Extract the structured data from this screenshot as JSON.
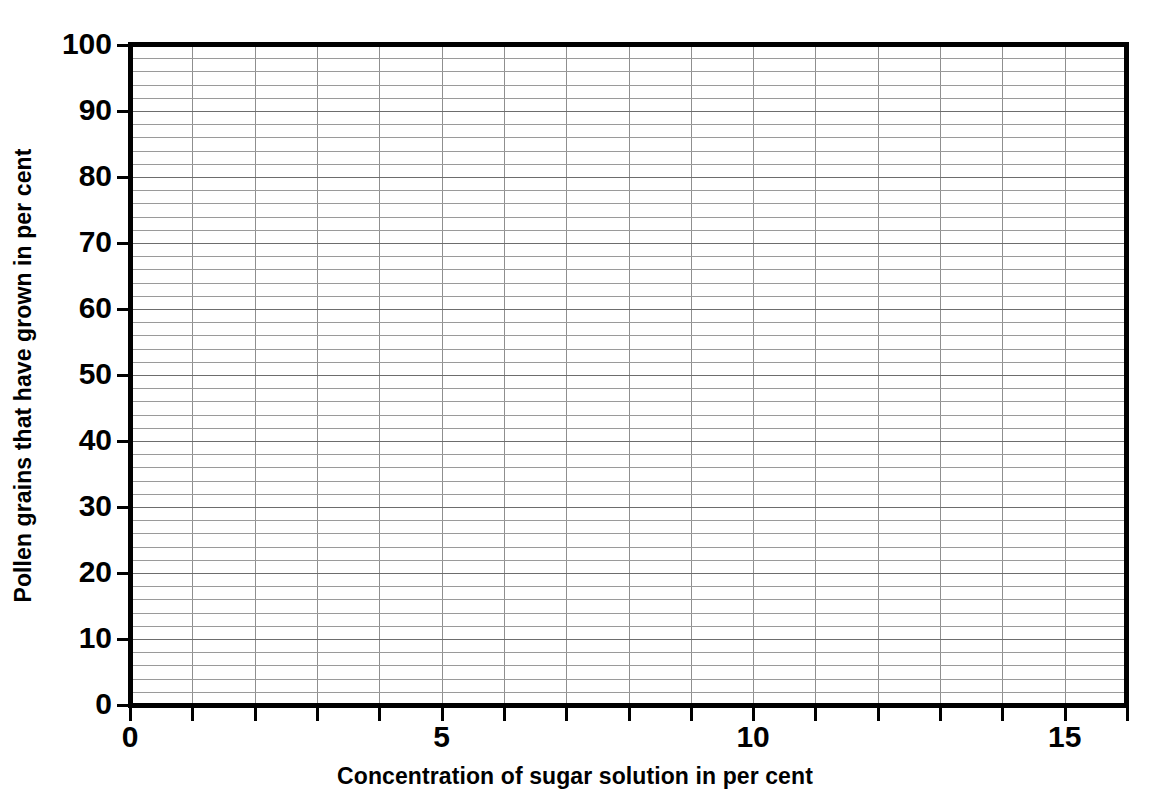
{
  "chart_data": {
    "type": "line",
    "title": "",
    "subtitle": "",
    "xlabel": "Concentration of sugar solution in per cent",
    "ylabel": "Pollen grains that have grown in per cent",
    "xlim": [
      0,
      16
    ],
    "ylim": [
      0,
      100
    ],
    "x_tick_labels": [
      "0",
      "5",
      "10",
      "15"
    ],
    "x_tick_values": [
      0,
      5,
      10,
      15
    ],
    "x_minor_tick_values": [
      0,
      1,
      2,
      3,
      4,
      5,
      6,
      7,
      8,
      9,
      10,
      11,
      12,
      13,
      14,
      15,
      16
    ],
    "y_tick_labels": [
      "0",
      "10",
      "20",
      "30",
      "40",
      "50",
      "60",
      "70",
      "80",
      "90",
      "100"
    ],
    "y_tick_values": [
      0,
      10,
      20,
      30,
      40,
      50,
      60,
      70,
      80,
      90,
      100
    ],
    "y_minor_step": 2,
    "grid": true,
    "grid_vertical_step": 1,
    "grid_horizontal_minor_step": 2,
    "legend": null,
    "legend_position": "none",
    "series": [],
    "annotations": [],
    "note": "Empty graph paper / blank axes — no data series plotted",
    "colors": {
      "axis": "#000000",
      "grid_major": "#6d6d6d",
      "grid_minor": "#9a9a9a",
      "background": "#ffffff",
      "text": "#000000"
    }
  }
}
